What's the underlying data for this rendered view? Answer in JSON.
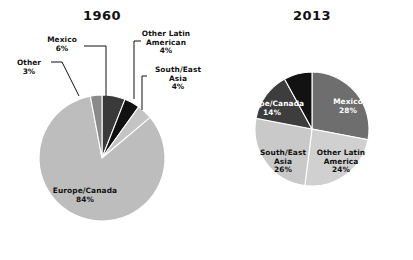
{
  "figure": {
    "background": "#ffffff",
    "width": 413,
    "height": 260
  },
  "chart_data": [
    {
      "type": "pie",
      "title": "1960",
      "id": "chart-1960",
      "center": [
        102,
        158
      ],
      "radius": 63,
      "start_angle_deg": -90,
      "direction": "clockwise",
      "label_position": "outside-with-leaders",
      "legend": "none",
      "grid": false,
      "categories": [
        "Mexico",
        "Other Latin American",
        "South/East Asia",
        "Europe/Canada",
        "Other"
      ],
      "values": [
        6,
        4,
        4,
        84,
        3
      ],
      "value_labels": [
        "6%",
        "4%",
        "4%",
        "84%",
        "3%"
      ],
      "colors": [
        "#3a3a3a",
        "#111111",
        "#c4c4c4",
        "#bdbdbd",
        "#8a8a8a"
      ],
      "slices": [
        {
          "name": "Mexico",
          "value": 6,
          "pct_label": "6%",
          "color": "#3a3a3a",
          "label_lines": [
            "Mexico"
          ],
          "label_fill": "dark",
          "label_x": 62,
          "label_y": 42,
          "leader": "M 84,46 L 106,46 L 106,96"
        },
        {
          "name": "Other Latin American",
          "value": 4,
          "pct_label": "4%",
          "color": "#111111",
          "label_lines": [
            "Other Latin",
            "American"
          ],
          "label_fill": "dark",
          "label_x": 166,
          "label_y": 36,
          "leader": "M 141,41 L 134,41 L 134,99"
        },
        {
          "name": "South/East Asia",
          "value": 4,
          "pct_label": "4%",
          "color": "#c4c4c4",
          "label_lines": [
            "South/East",
            "Asia"
          ],
          "label_fill": "dark",
          "label_x": 178,
          "label_y": 72,
          "leader": "M 147,76 L 142,76 L 142,110"
        },
        {
          "name": "Europe/Canada",
          "value": 84,
          "pct_label": "84%",
          "color": "#bdbdbd",
          "label_lines": [
            "Europe/Canada"
          ],
          "label_fill": "dark",
          "label_x": 85,
          "label_y": 193,
          "leader": ""
        },
        {
          "name": "Other",
          "value": 3,
          "pct_label": "3%",
          "color": "#8a8a8a",
          "label_lines": [
            "Other"
          ],
          "label_fill": "dark",
          "label_x": 29,
          "label_y": 65,
          "leader": "M 51,62 L 62,62 L 79,96"
        }
      ]
    },
    {
      "type": "pie",
      "title": "2013",
      "id": "chart-2013",
      "center": [
        312,
        129
      ],
      "radius": 57,
      "start_angle_deg": -90,
      "direction": "clockwise",
      "label_position": "inside",
      "legend": "none",
      "grid": false,
      "categories": [
        "Mexico",
        "Other Latin America",
        "South/East Asia",
        "Europe/Canada",
        "Other"
      ],
      "values": [
        28,
        24,
        26,
        14,
        8
      ],
      "value_labels": [
        "28%",
        "24%",
        "26%",
        "14%",
        "8%"
      ],
      "colors": [
        "#6e6e6e",
        "#d0d0d0",
        "#c9c9c9",
        "#3d3d3d",
        "#121212"
      ],
      "slices": [
        {
          "name": "Mexico",
          "value": 28,
          "pct_label": "28%",
          "color": "#6e6e6e",
          "label_lines": [
            "Mexico"
          ],
          "label_fill": "light",
          "label_x": 348,
          "label_y": 104,
          "leader": ""
        },
        {
          "name": "Other Latin America",
          "value": 24,
          "pct_label": "24%",
          "color": "#d0d0d0",
          "label_lines": [
            "Other Latin",
            "America"
          ],
          "label_fill": "dark",
          "label_x": 341,
          "label_y": 155,
          "leader": ""
        },
        {
          "name": "South/East Asia",
          "value": 26,
          "pct_label": "26%",
          "color": "#c9c9c9",
          "label_lines": [
            "South/East",
            "Asia"
          ],
          "label_fill": "dark",
          "label_x": 283,
          "label_y": 155,
          "leader": ""
        },
        {
          "name": "Europe/Canada",
          "value": 14,
          "pct_label": "14%",
          "color": "#3d3d3d",
          "label_lines": [
            "Europe/Canada"
          ],
          "label_fill": "light",
          "label_x": 272,
          "label_y": 106,
          "leader": ""
        },
        {
          "name": "Other",
          "value": 8,
          "pct_label": "8%",
          "color": "#121212",
          "label_lines": [
            "Other"
          ],
          "label_fill": "light",
          "label_x": 306,
          "label_y": 56,
          "leader": ""
        }
      ]
    }
  ],
  "titles": {
    "left": "1960",
    "right": "2013",
    "left_x": 102,
    "left_y": 20,
    "right_x": 312,
    "right_y": 20
  }
}
